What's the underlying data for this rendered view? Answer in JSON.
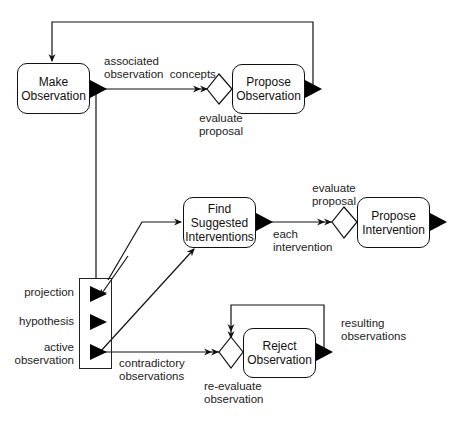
{
  "diagram": {
    "type": "process-flow",
    "nodes": {
      "make_observation": {
        "label_line1": "Make",
        "label_line2": "Observation"
      },
      "propose_observation": {
        "label_line1": "Propose",
        "label_line2": "Observation"
      },
      "find_suggested_interventions": {
        "label_line1": "Find",
        "label_line2": "Suggested",
        "label_line3": "Interventions"
      },
      "propose_intervention": {
        "label_line1": "Propose",
        "label_line2": "Intervention"
      },
      "reject_observation": {
        "label_line1": "Reject",
        "label_line2": "Observation"
      }
    },
    "decisions": {
      "evaluate_proposal_1": {
        "label_line1": "evaluate",
        "label_line2": "proposal"
      },
      "evaluate_proposal_2": {
        "label_line1": "evaluate",
        "label_line2": "proposal"
      },
      "re_evaluate_observation": {
        "label_line1": "re-evaluate",
        "label_line2": "observation"
      }
    },
    "edge_labels": {
      "associated_concepts_line1": "associated",
      "associated_concepts_line2": "observation  concepts",
      "each_intervention_line1": "each",
      "each_intervention_line2": "intervention",
      "contradictory_line1": "contradictory",
      "contradictory_line2": "observations",
      "resulting_line1": "resulting",
      "resulting_line2": "observations"
    },
    "ports": {
      "projection": "projection",
      "hypothesis": "hypothesis",
      "active_observation_line1": "active",
      "active_observation_line2": "observation"
    },
    "colors": {
      "stroke": "#111111",
      "background": "#ffffff"
    }
  }
}
